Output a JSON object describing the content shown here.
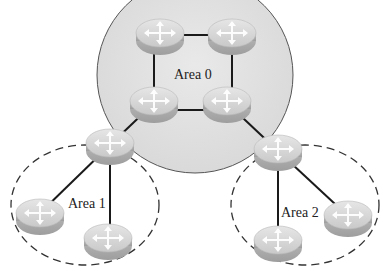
{
  "diagram": {
    "colors": {
      "backbone_fill": "#e2e2e2",
      "backbone_stroke": "#555555",
      "area_stroke": "#333333",
      "link": "#1a1a1a",
      "router_top": "#d9d9d9",
      "router_side": "#b5b5b5",
      "arrow": "#ffffff"
    },
    "areas": [
      {
        "id": "area0",
        "label": "Area 0",
        "type": "backbone",
        "style": "solid-filled"
      },
      {
        "id": "area1",
        "label": "Area 1",
        "type": "standard",
        "style": "dashed"
      },
      {
        "id": "area2",
        "label": "Area 2",
        "type": "standard",
        "style": "dashed"
      }
    ],
    "routers": [
      {
        "id": "r0a",
        "area": "area0",
        "x": 162,
        "y": 35
      },
      {
        "id": "r0b",
        "area": "area0",
        "x": 228,
        "y": 35
      },
      {
        "id": "r0c",
        "area": "area0",
        "x": 154,
        "y": 103
      },
      {
        "id": "r0d",
        "area": "area0",
        "x": 227,
        "y": 103
      },
      {
        "id": "abr1",
        "area": "area0/area1",
        "x": 110,
        "y": 145
      },
      {
        "id": "abr2",
        "area": "area0/area2",
        "x": 278,
        "y": 151
      },
      {
        "id": "r1a",
        "area": "area1",
        "x": 38,
        "y": 215
      },
      {
        "id": "r1b",
        "area": "area1",
        "x": 108,
        "y": 240
      },
      {
        "id": "r2a",
        "area": "area2",
        "x": 278,
        "y": 242
      },
      {
        "id": "r2b",
        "area": "area2",
        "x": 349,
        "y": 217
      }
    ],
    "links": [
      [
        "r0a",
        "r0b"
      ],
      [
        "r0a",
        "r0c"
      ],
      [
        "r0b",
        "r0d"
      ],
      [
        "r0c",
        "r0d"
      ],
      [
        "r0c",
        "abr1"
      ],
      [
        "r0d",
        "abr2"
      ],
      [
        "abr1",
        "r1a"
      ],
      [
        "abr1",
        "r1b"
      ],
      [
        "abr2",
        "r2a"
      ],
      [
        "abr2",
        "r2b"
      ]
    ]
  }
}
